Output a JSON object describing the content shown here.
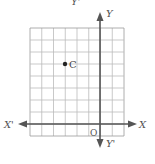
{
  "figure": {
    "type": "coordinate-plane",
    "grid": {
      "left": 30,
      "top": 28,
      "cols": 8,
      "rows": 9,
      "cell_w": 11.75,
      "cell_h": 12,
      "line_color": "#bbbbbb",
      "border_color": "#999999"
    },
    "axes": {
      "color": "#555555",
      "origin_px": {
        "x": 100,
        "y": 124
      },
      "x_axis": {
        "from": 18,
        "to": 137,
        "label_pos": "X",
        "label_neg": "X'"
      },
      "y_axis": {
        "from": 12,
        "to": 148,
        "label_pos": "Y",
        "label_neg": "Y'"
      }
    },
    "labels": {
      "top_y_prime": "Y'",
      "y": "Y",
      "x_prime": "X'",
      "x": "X",
      "origin": "O",
      "bottom_y_prime": "Y'"
    },
    "points": [
      {
        "name": "C",
        "label": "C",
        "px": {
          "x": 65,
          "y": 64
        },
        "grid": {
          "x": -3,
          "y": 5
        }
      }
    ]
  }
}
